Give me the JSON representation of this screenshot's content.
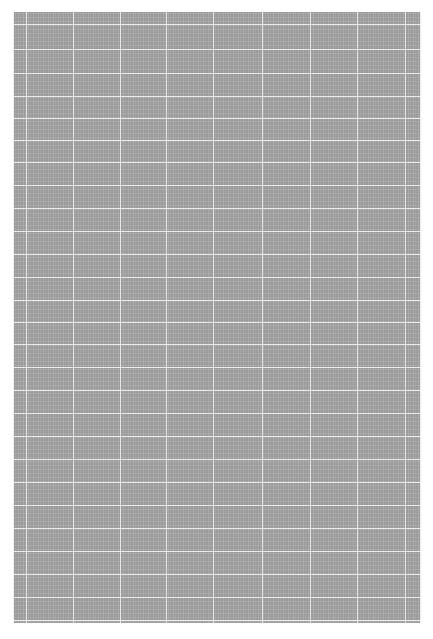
{
  "page": {
    "width": 433,
    "height": 639,
    "background_color": "#ffffff"
  },
  "content_block": {
    "description": "Dense text block rendered at extreme zoom-out; no glyphs legible",
    "left": 13,
    "top": 12,
    "width": 408,
    "height": 611,
    "fill_color": "#9d9d9d",
    "rule_color": "#ffffff"
  },
  "grid": {
    "column_rule_x": [
      26,
      73,
      120,
      166,
      213,
      262,
      310,
      357,
      405
    ],
    "row_rule_y": [
      24,
      49,
      73,
      96,
      118,
      140,
      162,
      185,
      208,
      231,
      254,
      277,
      300,
      322,
      344,
      367,
      390,
      413,
      436,
      459,
      482,
      505,
      528,
      551,
      574,
      597,
      620
    ]
  }
}
